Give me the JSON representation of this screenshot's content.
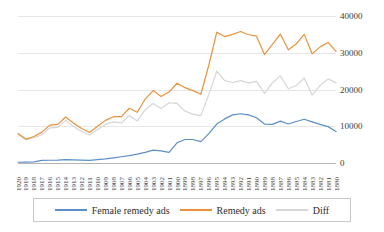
{
  "chart_data": {
    "type": "line",
    "title": "",
    "subtitle": "",
    "xlabel": "",
    "ylabel": "",
    "ylim": [
      0,
      40000
    ],
    "ytick_labels": [
      "40000",
      "30000",
      "20000",
      "10000",
      "0"
    ],
    "ytick_values": [
      40000,
      30000,
      20000,
      10000,
      0
    ],
    "grid": true,
    "legend_position": "bottom",
    "categories": [
      "1920",
      "1919",
      "1918",
      "1917",
      "1916",
      "1915",
      "1914",
      "1913",
      "1912",
      "1911",
      "1910",
      "1909",
      "1908",
      "1907",
      "1906",
      "1905",
      "1904",
      "1903",
      "1902",
      "1901",
      "1900",
      "1899",
      "1898",
      "1897",
      "1896",
      "1895",
      "1894",
      "1893",
      "1892",
      "1891",
      "1890",
      "1889",
      "1888",
      "1887",
      "1886",
      "1885",
      "1884",
      "1883",
      "1882",
      "1881",
      "1880"
    ],
    "series": [
      {
        "name": "Female remedy ads",
        "color": "#5B8FC9",
        "values": [
          200,
          250,
          300,
          700,
          750,
          800,
          900,
          850,
          800,
          700,
          900,
          1100,
          1400,
          1700,
          2000,
          2400,
          2900,
          3500,
          3300,
          2900,
          5500,
          6400,
          6400,
          5800,
          8000,
          10600,
          12000,
          13100,
          13400,
          13100,
          12300,
          10600,
          10500,
          11400,
          10600,
          11300,
          11900,
          11200,
          10500,
          9900,
          8600
        ]
      },
      {
        "name": "Remedy ads",
        "color": "#E8933C",
        "values": [
          8000,
          6500,
          7200,
          8400,
          10300,
          10500,
          12500,
          10800,
          9400,
          8300,
          10000,
          11600,
          12600,
          12600,
          14900,
          13800,
          17400,
          19700,
          18100,
          19300,
          21700,
          20500,
          19700,
          18700,
          26600,
          35600,
          34400,
          35000,
          35800,
          34900,
          34500,
          29500,
          32300,
          35100,
          30800,
          32400,
          35000,
          29700,
          31600,
          32800,
          30400
        ]
      },
      {
        "name": "Diff",
        "color": "#D6D6D6",
        "values": [
          7800,
          6250,
          6900,
          7700,
          9550,
          9700,
          11600,
          9950,
          8600,
          7600,
          9100,
          10500,
          11200,
          10900,
          12900,
          11400,
          14500,
          16200,
          14800,
          16400,
          16200,
          14100,
          13300,
          12900,
          18600,
          25000,
          22400,
          21900,
          22400,
          21800,
          22200,
          18900,
          21800,
          23700,
          20200,
          21100,
          23100,
          18500,
          21100,
          22900,
          21800
        ]
      }
    ]
  },
  "legend": {
    "entries": [
      {
        "label": "Female remedy ads",
        "color": "#5B8FC9"
      },
      {
        "label": "Remedy ads",
        "color": "#E8933C"
      },
      {
        "label": "Diff",
        "color": "#D6D6D6"
      }
    ]
  }
}
